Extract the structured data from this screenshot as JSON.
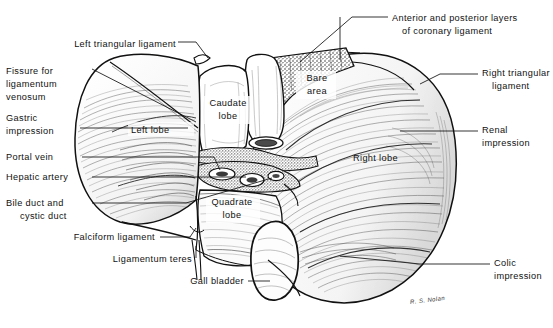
{
  "figure": {
    "type": "anatomical-line-drawing",
    "signature": "R. S. Nolan"
  },
  "labels": {
    "left_triangular_ligament": "Left triangular ligament",
    "fissure_for_ligamentum_venosum_l1": "Fissure for",
    "fissure_for_ligamentum_venosum_l2": "ligamentum",
    "fissure_for_ligamentum_venosum_l3": "venosum",
    "gastric_impression_l1": "Gastric",
    "gastric_impression_l2": "impression",
    "portal_vein": "Portal vein",
    "hepatic_artery": "Hepatic artery",
    "bile_duct_l1": "Bile duct and",
    "bile_duct_l2": "cystic duct",
    "falciform_ligament": "Falciform ligament",
    "ligamentum_teres": "Ligamentum teres",
    "gall_bladder": "Gall bladder",
    "coronary_ligament_l1": "Anterior and posterior layers",
    "coronary_ligament_l2": "of coronary ligament",
    "right_triangular_ligament_l1": "Right triangular",
    "right_triangular_ligament_l2": "ligament",
    "renal_impression_l1": "Renal",
    "renal_impression_l2": "impression",
    "colic_impression_l1": "Colic",
    "colic_impression_l2": "impression",
    "bare_area_l1": "Bare",
    "bare_area_l2": "area",
    "caudate_lobe_l1": "Caudate",
    "caudate_lobe_l2": "lobe",
    "quadrate_lobe_l1": "Quadrate",
    "quadrate_lobe_l2": "lobe",
    "left_lobe": "Left lobe",
    "right_lobe": "Right lobe"
  },
  "colors": {
    "ink": "#111111",
    "background": "#ffffff",
    "shade": "#5a5a5a"
  }
}
